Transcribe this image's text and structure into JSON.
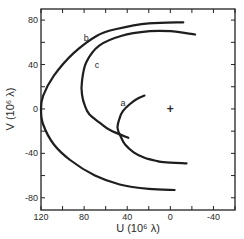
{
  "chart_data": {
    "type": "line",
    "title": "",
    "xlabel": "U (10⁶ λ)",
    "ylabel": "V (10⁶ λ)",
    "xlim": [
      120,
      -60
    ],
    "ylim": [
      -91,
      90
    ],
    "x_inverted": true,
    "xticks": [
      120,
      80,
      40,
      0,
      -40
    ],
    "xtick_labels": [
      "120",
      "80",
      "40",
      "0",
      "-40"
    ],
    "yticks": [
      80,
      40,
      0,
      -40,
      -80
    ],
    "ytick_labels": [
      "80",
      "40",
      "0",
      "-40",
      "-80"
    ],
    "minor_x_step": 20,
    "minor_y_step": 20,
    "grid": false,
    "legend": "none",
    "annotations": [
      {
        "text": "b",
        "u": 78,
        "v": 64
      },
      {
        "text": "c",
        "u": 68,
        "v": 40
      },
      {
        "text": "a",
        "u": 44,
        "v": 5
      },
      {
        "text": "+",
        "u": 0,
        "v": 0,
        "meaning": "origin marker"
      }
    ],
    "series": [
      {
        "name": "b",
        "points": [
          [
            -12,
            78
          ],
          [
            20,
            77
          ],
          [
            50,
            72
          ],
          [
            68,
            66
          ],
          [
            90,
            50
          ],
          [
            108,
            30
          ],
          [
            118,
            12
          ],
          [
            120,
            0
          ],
          [
            118,
            -14
          ],
          [
            108,
            -32
          ],
          [
            93,
            -46
          ],
          [
            70,
            -60
          ],
          [
            47,
            -68
          ],
          [
            20,
            -72
          ],
          [
            -4,
            -73
          ]
        ]
      },
      {
        "name": "c",
        "points": [
          [
            -23,
            67
          ],
          [
            0,
            70
          ],
          [
            19,
            70
          ],
          [
            45,
            66
          ],
          [
            66,
            57
          ],
          [
            78,
            42
          ],
          [
            82,
            25
          ],
          [
            82,
            13
          ],
          [
            79,
            2
          ],
          [
            75,
            -5
          ],
          [
            66,
            -12
          ],
          [
            56,
            -19
          ],
          [
            39,
            -26
          ]
        ]
      },
      {
        "name": "a",
        "points": [
          [
            24,
            12
          ],
          [
            31,
            9
          ],
          [
            38,
            4
          ],
          [
            44,
            -2
          ],
          [
            47,
            -8
          ],
          [
            49,
            -17
          ],
          [
            46,
            -25
          ],
          [
            42,
            -32
          ],
          [
            34,
            -39
          ],
          [
            24,
            -44
          ],
          [
            12,
            -47
          ],
          [
            6,
            -48
          ],
          [
            -15,
            -49
          ]
        ]
      }
    ]
  }
}
